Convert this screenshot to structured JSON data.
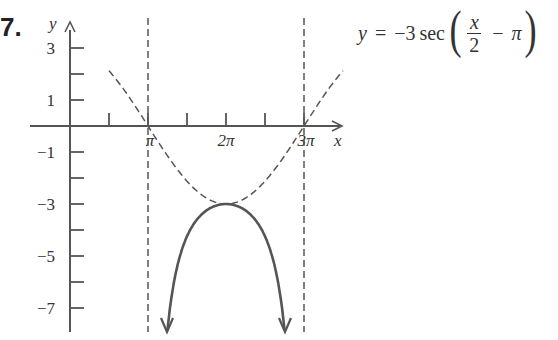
{
  "problem": {
    "number": "7."
  },
  "equation": {
    "lhs": "y",
    "equals": "=",
    "coef": "−3",
    "func": "sec",
    "numerator": "x",
    "denominator": "2",
    "minus": "−",
    "shift": "π",
    "open_paren": "(",
    "close_paren": ")"
  },
  "chart_data": {
    "type": "line",
    "xlabel": "x",
    "ylabel": "y",
    "x_ticks": [
      "π",
      "2π",
      "3π"
    ],
    "y_ticks": [
      "3",
      "1",
      "−1",
      "−3",
      "−5",
      "−7"
    ],
    "xlim": [
      0,
      3.5
    ],
    "ylim": [
      -8,
      4
    ],
    "asymptotes_x": [
      "π",
      "3π"
    ],
    "series": [
      {
        "name": "y = −3 sec(x/2 − π)",
        "style": "solid",
        "x": [
          "π⁺",
          "1.5π",
          "2π",
          "2.5π",
          "3π⁻"
        ],
        "values": [
          -8,
          -4.24,
          -3,
          -4.24,
          -8
        ]
      },
      {
        "name": "y = −3 cos(x/2 − π) (guide)",
        "style": "dashed",
        "x": [
          "0.5π",
          "π",
          "2π",
          "3π",
          "3.5π"
        ],
        "values": [
          2.12,
          0,
          -3,
          0,
          2.12
        ]
      }
    ],
    "grid": false,
    "annotations": [
      "vertex (2π, −3)"
    ]
  }
}
